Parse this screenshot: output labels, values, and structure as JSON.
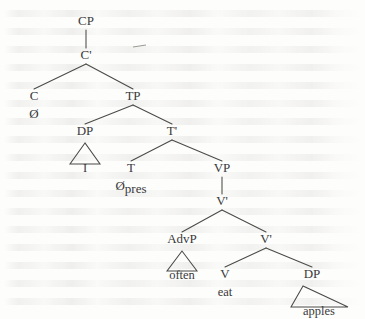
{
  "figure": {
    "kind": "x-bar-syntax-tree",
    "sentence": "I often eat apples",
    "ink_color": "#4a4a46",
    "text_color": "#39393a",
    "background_color": "#fdfdfc",
    "width": 365,
    "height": 319
  },
  "nodes": {
    "cp": {
      "label": "CP",
      "x": 86,
      "y": 25
    },
    "cbar": {
      "label": "C'",
      "x": 86,
      "y": 59
    },
    "c": {
      "label": "C",
      "x": 34,
      "y": 100
    },
    "c_head": {
      "label": "Ø",
      "x": 34,
      "y": 118
    },
    "tp": {
      "label": "TP",
      "x": 133,
      "y": 100
    },
    "dp1": {
      "label": "DP",
      "x": 85,
      "y": 135
    },
    "dp1_leaf": {
      "label": "I",
      "x": 85,
      "y": 172
    },
    "tbar": {
      "label": "T'",
      "x": 172,
      "y": 135
    },
    "t": {
      "label": "T",
      "x": 131,
      "y": 172
    },
    "t_head": {
      "label": "Ø",
      "sub": "pres",
      "x": 131,
      "y": 190
    },
    "vp": {
      "label": "VP",
      "x": 222,
      "y": 172
    },
    "vbar1": {
      "label": "V'",
      "x": 222,
      "y": 205
    },
    "advp": {
      "label": "AdvP",
      "x": 182,
      "y": 243
    },
    "advp_leaf": {
      "label": "often",
      "x": 182,
      "y": 279
    },
    "vbar2": {
      "label": "V'",
      "x": 266,
      "y": 243
    },
    "v": {
      "label": "V",
      "x": 225,
      "y": 278
    },
    "v_leaf": {
      "label": "eat",
      "x": 225,
      "y": 296
    },
    "dp2": {
      "label": "DP",
      "x": 312,
      "y": 278
    },
    "dp2_leaf": {
      "label": "apples",
      "x": 319,
      "y": 315
    }
  },
  "edges": [
    {
      "name": "cp-to-cbar",
      "from": "cp",
      "to": "cbar",
      "style": "vertical"
    },
    {
      "name": "cbar-to-c",
      "from": "cbar",
      "to": "c",
      "style": "diagonal"
    },
    {
      "name": "cbar-to-tp",
      "from": "cbar",
      "to": "tp",
      "style": "diagonal"
    },
    {
      "name": "tp-to-dp",
      "from": "tp",
      "to": "dp1",
      "style": "diagonal"
    },
    {
      "name": "tp-to-tbar",
      "from": "tp",
      "to": "tbar",
      "style": "diagonal"
    },
    {
      "name": "tbar-to-t",
      "from": "tbar",
      "to": "t",
      "style": "diagonal"
    },
    {
      "name": "tbar-to-vp",
      "from": "tbar",
      "to": "vp",
      "style": "diagonal"
    },
    {
      "name": "vp-to-vbar",
      "from": "vp",
      "to": "vbar1",
      "style": "vertical"
    },
    {
      "name": "vbar-to-advp",
      "from": "vbar1",
      "to": "advp",
      "style": "diagonal"
    },
    {
      "name": "vbar-to-vbar",
      "from": "vbar1",
      "to": "vbar2",
      "style": "diagonal"
    },
    {
      "name": "vbar2-to-v",
      "from": "vbar2",
      "to": "v",
      "style": "diagonal"
    },
    {
      "name": "vbar2-to-dp",
      "from": "vbar2",
      "to": "dp2",
      "style": "diagonal"
    }
  ],
  "triangles": [
    {
      "name": "dp1-triangle",
      "apex_x": 85,
      "apex_y": 143,
      "left_x": 70,
      "right_x": 100,
      "base_y": 164,
      "leaf": "I"
    },
    {
      "name": "advp-triangle",
      "apex_x": 182,
      "apex_y": 251,
      "left_x": 167,
      "right_x": 197,
      "base_y": 271,
      "leaf": "often"
    },
    {
      "name": "dp2-triangle",
      "apex_x": 303,
      "apex_y": 286,
      "left_x": 291,
      "right_x": 348,
      "base_y": 307,
      "leaf": "apples"
    }
  ],
  "stray_mark": {
    "name": "stray-dash",
    "x1": 133,
    "y1": 47,
    "x2": 146,
    "y2": 45
  },
  "labels": {
    "cp": "CP",
    "cbar": "C'",
    "c": "C",
    "c_head": "Ø",
    "tp": "TP",
    "dp1": "DP",
    "dp1_leaf": "I",
    "tbar": "T'",
    "t": "T",
    "t_head": "Ø",
    "t_head_sub": "pres",
    "vp": "VP",
    "vbar1": "V'",
    "advp": "AdvP",
    "advp_leaf": "often",
    "vbar2": "V'",
    "v": "V",
    "v_leaf": "eat",
    "dp2": "DP",
    "dp2_leaf": "apples"
  }
}
